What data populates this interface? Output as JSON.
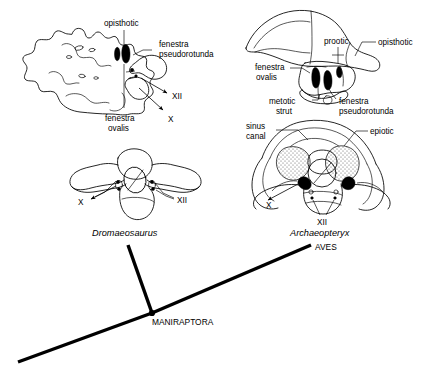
{
  "figure": {
    "type": "scientific-illustration",
    "background_color": "#ffffff",
    "ink_color": "#000000"
  },
  "panels": {
    "dromaeosaurus_lateral": {
      "view": "lateral",
      "labels": {
        "opisthotic": "opisthotic",
        "fenestra_pseudorotunda": "fenestra\npseudorotunda",
        "fenestra_pseudorotunda_line1": "fenestra",
        "fenestra_pseudorotunda_line2": "pseudorotunda",
        "fenestra_ovalis_line1": "fenestra",
        "fenestra_ovalis_line2": "ovalis",
        "nerve_xii": "XII",
        "nerve_x": "X"
      }
    },
    "archaeopteryx_lateral": {
      "view": "lateral",
      "labels": {
        "prootic": "prootic",
        "opisthotic": "opisthotic",
        "fenestra_ovalis_line1": "fenestra",
        "fenestra_ovalis_line2": "ovalis",
        "metotic_strut_line1": "metotic",
        "metotic_strut_line2": "strut",
        "fenestra_pseudorotunda_line1": "fenestra",
        "fenestra_pseudorotunda_line2": "pseudorotunda"
      }
    },
    "dromaeosaurus_posterior": {
      "view": "posterior/occipital",
      "labels": {
        "nerve_x": "X",
        "nerve_xii": "XII"
      },
      "taxon": "Dromaeosaurus"
    },
    "archaeopteryx_posterior": {
      "view": "posterior/occipital",
      "labels": {
        "sinus_canal_line1": "sinus",
        "sinus_canal_line2": "canal",
        "epiotic": "epiotic",
        "nerve_x": "X",
        "nerve_xii": "XII"
      },
      "taxon": "Archaeopteryx"
    }
  },
  "cladogram": {
    "nodes": [
      {
        "name": "MANIRAPTORA",
        "label": "MANIRAPTORA"
      }
    ],
    "terminals": [
      {
        "name": "AVES",
        "label": "AVES"
      }
    ]
  }
}
